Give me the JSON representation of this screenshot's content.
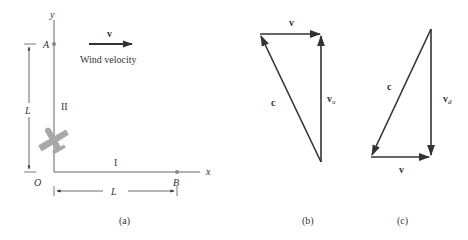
{
  "figure_a": {
    "caption": "(a)",
    "axis_x_label": "x",
    "axis_y_label": "y",
    "origin_label": "O",
    "point_a_label": "A",
    "point_b_label": "B",
    "dimension_vertical_label": "L",
    "dimension_horizontal_label": "L",
    "leg_I_label": "I",
    "leg_II_label": "II",
    "wind_vector_label": "v",
    "wind_caption": "Wind velocity"
  },
  "figure_b": {
    "caption": "(b)",
    "top_vector_label": "v",
    "hypotenuse_label": "c",
    "vertical_vector_label": "v",
    "vertical_vector_subscript": "u"
  },
  "figure_c": {
    "caption": "(c)",
    "bottom_vector_label": "v",
    "hypotenuse_label": "c",
    "vertical_vector_label": "v",
    "vertical_vector_subscript": "d"
  },
  "colors": {
    "line": "#555555",
    "arrow": "#333333",
    "airplane": "#a8a8a8",
    "point": "#888888"
  }
}
